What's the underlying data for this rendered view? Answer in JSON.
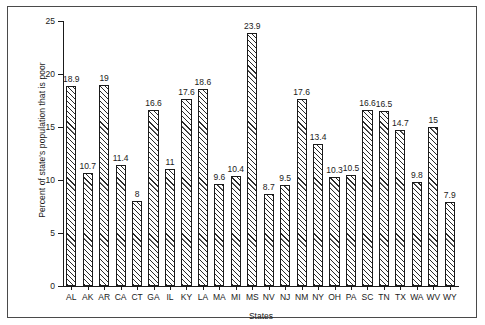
{
  "chart_data": {
    "type": "bar",
    "title": "",
    "xlabel": "States",
    "ylabel": "Percent of state's population that is poor",
    "ylim": [
      0,
      25
    ],
    "yticks": [
      0,
      5,
      10,
      15,
      20,
      25
    ],
    "ytick_labels": [
      "0",
      "5",
      "10",
      "15",
      "20",
      "25"
    ],
    "grid": false,
    "legend": null,
    "categories": [
      "AL",
      "AK",
      "AR",
      "CA",
      "CT",
      "GA",
      "IL",
      "KY",
      "LA",
      "MA",
      "MI",
      "MS",
      "NV",
      "NJ",
      "NM",
      "NY",
      "OH",
      "PA",
      "SC",
      "TN",
      "TX",
      "WA",
      "WV",
      "WY"
    ],
    "values": [
      18.9,
      10.7,
      19,
      11.4,
      8,
      16.6,
      11,
      17.6,
      18.6,
      9.6,
      10.4,
      23.9,
      8.7,
      9.5,
      17.6,
      13.4,
      10.3,
      10.5,
      16.6,
      16.5,
      14.7,
      9.8,
      15,
      7.9
    ],
    "value_labels": [
      "18.9",
      "10.7",
      "19",
      "11.4",
      "8",
      "16.6",
      "11",
      "17.6",
      "18.6",
      "9.6",
      "10.4",
      "23.9",
      "8.7",
      "9.5",
      "17.6",
      "13.4",
      "10.3",
      "10.5",
      "16.6",
      "16.5",
      "14.7",
      "9.8",
      "15",
      "7.9"
    ],
    "bar_fill": "hatched-diagonal",
    "bar_edge_color": "#1a1a1a",
    "background_color": "#ffffff"
  }
}
